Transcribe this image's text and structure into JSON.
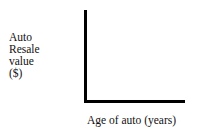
{
  "chart_data": {
    "type": "line",
    "title": "",
    "subtitle": "",
    "xlabel": "Age of auto (years)",
    "ylabel": "Auto Resale value ($)",
    "ylabel_lines": [
      "Auto",
      "Resale",
      "value",
      "($)"
    ],
    "categories": [],
    "x": [],
    "values": [],
    "series": [],
    "annotations": [],
    "legend": {
      "entries": [],
      "position": "none"
    },
    "axes": {
      "style": "L-shaped",
      "x_ticks": [],
      "y_ticks": [],
      "x_tick_labels": [],
      "y_tick_labels": [],
      "xlim": null,
      "ylim": null,
      "grid": false,
      "axis_color": "#000000",
      "axis_line_width_px": 3
    },
    "background_color": "#ffffff",
    "text_color": "#111111",
    "note": "Blank axes with no plotted data points"
  }
}
